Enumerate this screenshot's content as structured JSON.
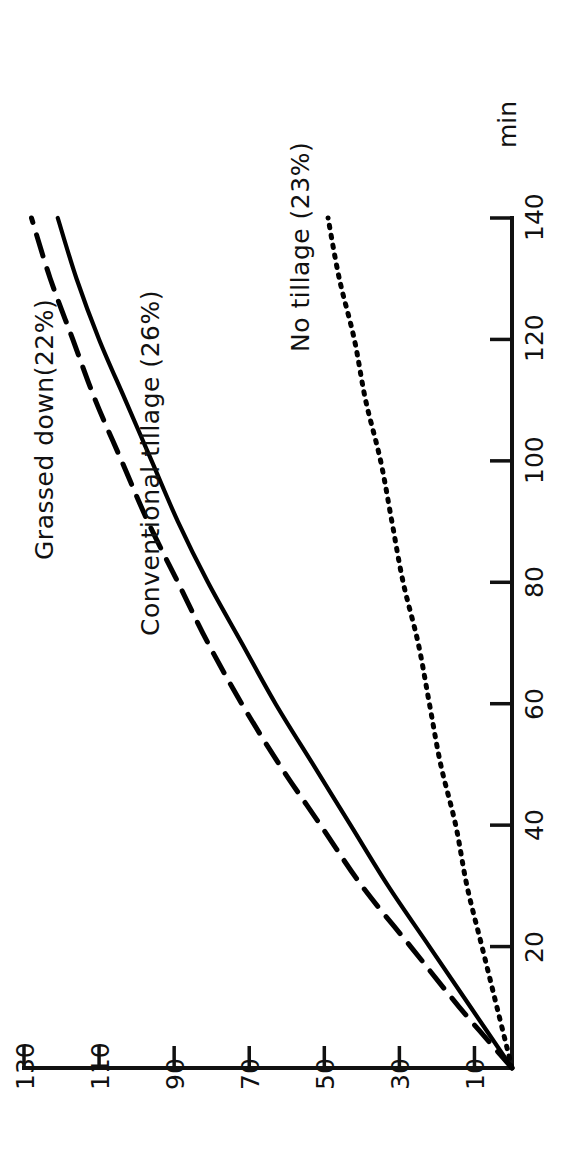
{
  "chart_data": {
    "type": "line",
    "title": "",
    "orientation": "rotated-90-ccw",
    "xlabel": "min",
    "ylabel": "",
    "xlim": [
      0,
      140
    ],
    "ylim": [
      0,
      130
    ],
    "x_ticks": [
      20,
      40,
      60,
      80,
      100,
      120,
      140
    ],
    "x_tick_labels": [
      "20",
      "40",
      "60",
      "80",
      "100",
      "120",
      "140"
    ],
    "y_ticks": [
      10,
      30,
      50,
      70,
      90,
      110,
      130
    ],
    "y_tick_labels": [
      "10",
      "30",
      "50",
      "70",
      "90",
      "110",
      "130"
    ],
    "grid": false,
    "legend_position": "inline-annotations",
    "x": [
      0,
      10,
      20,
      30,
      40,
      50,
      60,
      70,
      80,
      90,
      100,
      110,
      120,
      130,
      140
    ],
    "series": [
      {
        "name": "Grassed down(22%)",
        "style": "dashed",
        "color": "#000000",
        "values": [
          0,
          14,
          27,
          40,
          51,
          62,
          72,
          81,
          89,
          97,
          104,
          111,
          117,
          123,
          128
        ]
      },
      {
        "name": "Conventional tillage (26%)",
        "style": "solid",
        "color": "#000000",
        "values": [
          0,
          11,
          22,
          33,
          43,
          53,
          63,
          72,
          81,
          89,
          96,
          103,
          110,
          116,
          121
        ]
      },
      {
        "name": "No tillage (23%)",
        "style": "dotted",
        "color": "#000000",
        "values": [
          0,
          4,
          8,
          12,
          15,
          19,
          22,
          25,
          29,
          32,
          35,
          39,
          42,
          46,
          49
        ]
      }
    ]
  },
  "axes": {
    "time_axis": {
      "unit_label": "min",
      "ticks": [
        "20",
        "40",
        "60",
        "80",
        "100",
        "120",
        "140"
      ]
    },
    "value_axis": {
      "unit_label": "",
      "ticks": [
        "130",
        "110",
        "90",
        "70",
        "50",
        "30",
        "10"
      ]
    }
  },
  "annotations": [
    {
      "id": "grassed",
      "text": "Grassed down(22%)"
    },
    {
      "id": "conventional",
      "text": "Conventional tillage (26%)"
    },
    {
      "id": "notillage",
      "text": "No tillage (23%)"
    }
  ],
  "colors": {
    "ink": "#111111",
    "background": "#ffffff"
  }
}
